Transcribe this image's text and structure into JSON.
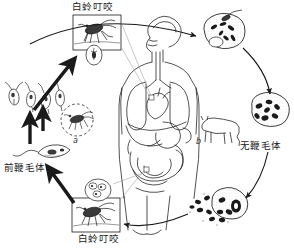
{
  "diagram": {
    "ink_color": "#1a1a1a",
    "background_color": "#ffffff",
    "labels": {
      "sandfly_bite_top": "白蛉叮咬",
      "sandfly_bite_bottom": "白蛉叮咬",
      "promastigote": "前鞭毛体",
      "amastigote": "无鞭毛体",
      "marker_a": "a",
      "marker_b": "b"
    },
    "nodes": [
      {
        "id": "sandfly-box-top",
        "name": "sandfly-biting-illustration-top",
        "label": "白蛉叮咬"
      },
      {
        "id": "sandfly-box-bottom",
        "name": "sandfly-biting-illustration-bottom",
        "label": "白蛉叮咬"
      },
      {
        "id": "promastigote-group",
        "name": "promastigote-chain",
        "label": ""
      },
      {
        "id": "promastigote-cell",
        "name": "promastigote-single",
        "label": "前鞭毛体"
      },
      {
        "id": "sandfly-dashed-circle",
        "name": "sandfly-in-dashed-circle",
        "label": "a"
      },
      {
        "id": "reservoir-animal",
        "name": "reservoir-host-animal",
        "label": "b"
      },
      {
        "id": "human-body",
        "name": "human-torso-anatomy",
        "label": ""
      },
      {
        "id": "macrophage-infected",
        "name": "macrophage-with-amastigotes",
        "label": ""
      },
      {
        "id": "macrophage-amastigote",
        "name": "macrophage-amastigote-cell",
        "label": "无鞭毛体"
      },
      {
        "id": "macrophage-rupture",
        "name": "ruptured-macrophage-releasing-amastigotes",
        "label": ""
      },
      {
        "id": "amastigote-cluster-top",
        "name": "amastigote-cluster-in-sandfly-gut",
        "label": ""
      }
    ],
    "arrows": [
      {
        "name": "arrow-promastigote-to-sandfly-top",
        "style": "thick-solid"
      },
      {
        "name": "arrow-sandfly-top-to-macrophage",
        "style": "thin-curve"
      },
      {
        "name": "arrow-macrophage-to-amastigote",
        "style": "thin-curve"
      },
      {
        "name": "arrow-amastigote-to-rupture",
        "style": "thin-curve"
      },
      {
        "name": "arrow-rupture-to-sandfly-bottom",
        "style": "thin-curve"
      },
      {
        "name": "arrow-sandfly-bottom-to-promastigote",
        "style": "thick-solid"
      },
      {
        "name": "arrow-promastigote-chain-up",
        "style": "thick-solid"
      },
      {
        "name": "arrow-promastigote-to-chain",
        "style": "thick-solid"
      },
      {
        "name": "leader-sandfly-top-to-body",
        "style": "hairline"
      },
      {
        "name": "leader-sandfly-bottom-to-body",
        "style": "hairline"
      }
    ]
  }
}
